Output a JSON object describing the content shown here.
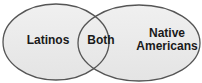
{
  "diagram": {
    "type": "venn",
    "sets": [
      {
        "id": "left",
        "label": "Latinos"
      },
      {
        "id": "right",
        "label_line1": "Native",
        "label_line2": "Americans",
        "label": "Native Americans"
      }
    ],
    "intersection": {
      "label": "Both"
    },
    "colors": {
      "fill": "#ebebeb",
      "outline": "#555555",
      "text": "#1a1a1a"
    }
  }
}
